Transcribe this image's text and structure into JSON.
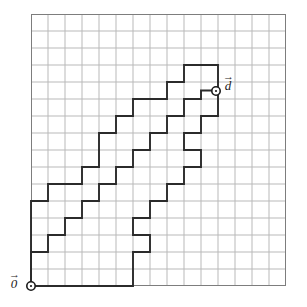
{
  "figure": {
    "colors": {
      "grid_line": "#b9b9b9",
      "grid_border": "#7d7d7d",
      "path_stroke": "#2b2b2b",
      "marker_stroke": "#1a1a1a",
      "background": "#ffffff",
      "label_text": "#1a1a1a"
    },
    "grid": {
      "columns": 15,
      "rows": 16,
      "cell_size_px": 17,
      "origin_px": {
        "x": 31,
        "y": 286
      },
      "left_px": 31,
      "top_px": 14,
      "right_px": 286,
      "bottom_px": 286
    },
    "markers": [
      {
        "name": "origin-marker",
        "label": "0",
        "arrow_glyph": "→",
        "grid_point": {
          "x": 0,
          "y": 0
        },
        "px": {
          "x": 31,
          "y": 286
        },
        "radius_px": 4.2
      },
      {
        "name": "destination-marker",
        "label": "d",
        "arrow_glyph": "→",
        "grid_point": {
          "x": 11,
          "y": 11.5
        },
        "px": {
          "x": 216,
          "y": 91
        },
        "radius_px": 4.2
      }
    ],
    "paths": [
      {
        "name": "path-lower",
        "points_grid": [
          [
            0,
            0
          ],
          [
            6,
            0
          ],
          [
            6,
            2
          ],
          [
            7,
            2
          ],
          [
            7,
            3
          ],
          [
            6,
            3
          ],
          [
            6,
            4
          ],
          [
            7,
            4
          ],
          [
            7,
            5
          ],
          [
            8,
            5
          ],
          [
            8,
            6
          ],
          [
            9,
            6
          ],
          [
            9,
            7
          ],
          [
            10,
            7
          ],
          [
            10,
            8
          ],
          [
            9,
            8
          ],
          [
            9,
            9
          ],
          [
            10,
            9
          ],
          [
            10,
            10
          ],
          [
            11,
            10
          ],
          [
            11,
            11
          ],
          [
            11,
            11.5
          ]
        ]
      },
      {
        "name": "path-middle",
        "points_grid": [
          [
            0,
            0
          ],
          [
            0,
            2
          ],
          [
            1,
            2
          ],
          [
            1,
            3
          ],
          [
            2,
            3
          ],
          [
            2,
            4
          ],
          [
            3,
            4
          ],
          [
            3,
            5
          ],
          [
            4,
            5
          ],
          [
            4,
            6
          ],
          [
            5,
            6
          ],
          [
            5,
            7
          ],
          [
            6,
            7
          ],
          [
            6,
            8
          ],
          [
            7,
            8
          ],
          [
            7,
            9
          ],
          [
            8,
            9
          ],
          [
            8,
            10
          ],
          [
            9,
            10
          ],
          [
            9,
            11
          ],
          [
            10,
            11
          ],
          [
            10,
            11.5
          ],
          [
            11,
            11.5
          ]
        ]
      },
      {
        "name": "path-upper",
        "points_grid": [
          [
            0,
            0
          ],
          [
            0,
            5
          ],
          [
            1,
            5
          ],
          [
            1,
            6
          ],
          [
            3,
            6
          ],
          [
            3,
            7
          ],
          [
            4,
            7
          ],
          [
            4,
            8
          ],
          [
            4,
            9
          ],
          [
            5,
            9
          ],
          [
            5,
            10
          ],
          [
            6,
            10
          ],
          [
            6,
            11
          ],
          [
            8,
            11
          ],
          [
            8,
            12
          ],
          [
            9,
            12
          ],
          [
            9,
            13
          ],
          [
            11,
            13
          ],
          [
            11,
            11.5
          ]
        ]
      }
    ],
    "labels": {
      "origin": {
        "name": "0",
        "arrow": "→"
      },
      "destination": {
        "name": "d",
        "arrow": "→"
      }
    }
  }
}
